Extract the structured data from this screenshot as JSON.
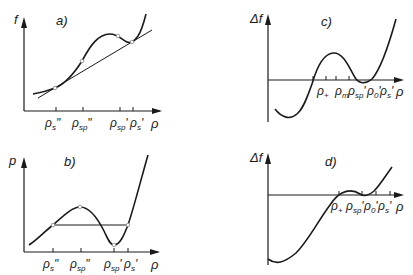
{
  "panels": {
    "a": {
      "tag": "a)",
      "y_axis": "f",
      "x_axis": "ρ",
      "ticks": [
        {
          "base": "ρ",
          "sub": "s",
          "prime": "\""
        },
        {
          "base": "ρ",
          "sub": "sp",
          "prime": "\""
        },
        {
          "base": "ρ",
          "sub": "sp",
          "prime": "'"
        },
        {
          "base": "ρ",
          "sub": "s",
          "prime": "'"
        }
      ]
    },
    "b": {
      "tag": "b)",
      "y_axis": "p",
      "x_axis": "ρ",
      "ticks": [
        {
          "base": "ρ",
          "sub": "s",
          "prime": "\""
        },
        {
          "base": "ρ",
          "sub": "sp",
          "prime": "\""
        },
        {
          "base": "ρ",
          "sub": "sp",
          "prime": "'"
        },
        {
          "base": "ρ",
          "sub": "s",
          "prime": "'"
        }
      ]
    },
    "c": {
      "tag": "c)",
      "y_axis": "Δf",
      "x_axis": "ρ",
      "ticks": [
        {
          "base": "ρ",
          "sub": "+",
          "prime": ""
        },
        {
          "base": "ρ",
          "sub": "m",
          "prime": ""
        },
        {
          "base": "ρ",
          "sub": "sp",
          "prime": "'"
        },
        {
          "base": "ρ",
          "sub": "0",
          "prime": "'"
        },
        {
          "base": "ρ",
          "sub": "s",
          "prime": "'"
        }
      ]
    },
    "d": {
      "tag": "d)",
      "y_axis": "Δf",
      "x_axis": "ρ",
      "ticks": [
        {
          "base": "ρ",
          "sub": "+",
          "prime": ""
        },
        {
          "base": "ρ",
          "sub": "sp",
          "prime": "'"
        },
        {
          "base": "ρ",
          "sub": "0",
          "prime": "'"
        },
        {
          "base": "ρ",
          "sub": "s",
          "prime": "'"
        }
      ]
    }
  },
  "colors": {
    "line": "#1a1a1a",
    "marker_fill": "#ffffff"
  }
}
